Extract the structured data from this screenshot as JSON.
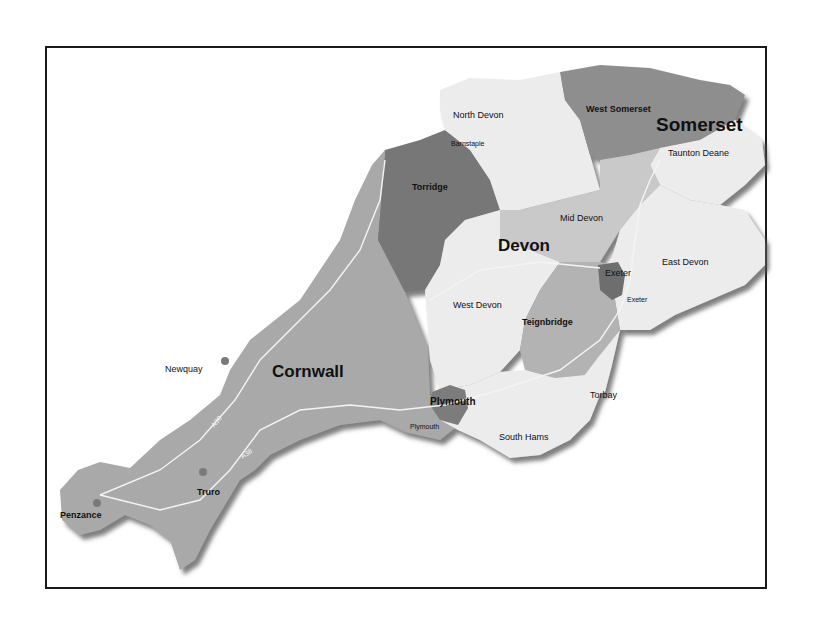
{
  "map": {
    "title": "South West England districts",
    "counties": [
      {
        "name": "Cornwall",
        "label": "Cornwall"
      },
      {
        "name": "Devon",
        "label": "Devon"
      },
      {
        "name": "Somerset",
        "label": "Somerset"
      }
    ],
    "districts": [
      {
        "name": "North Devon",
        "label": "North Devon"
      },
      {
        "name": "Barnstaple",
        "label": "Barnstaple"
      },
      {
        "name": "Torridge",
        "label": "Torridge"
      },
      {
        "name": "Mid Devon",
        "label": "Mid Devon"
      },
      {
        "name": "West Somerset",
        "label": "West Somerset"
      },
      {
        "name": "Taunton Deane",
        "label": "Taunton Deane"
      },
      {
        "name": "East Devon",
        "label": "East Devon"
      },
      {
        "name": "Exeter",
        "label": "Exeter"
      },
      {
        "name": "Exeter town",
        "label": "Exeter"
      },
      {
        "name": "West Devon",
        "label": "West Devon"
      },
      {
        "name": "Teignbridge",
        "label": "Teignbridge"
      },
      {
        "name": "Torbay",
        "label": "Torbay"
      },
      {
        "name": "Plymouth",
        "label": "Plymouth"
      },
      {
        "name": "Plymouth town",
        "label": "Plymouth"
      },
      {
        "name": "South Hams",
        "label": "South Hams"
      }
    ],
    "towns": [
      {
        "name": "Newquay",
        "label": "Newquay"
      },
      {
        "name": "Truro",
        "label": "Truro"
      },
      {
        "name": "Penzance",
        "label": "Penzance"
      }
    ],
    "roads": [
      {
        "name": "A30",
        "label": "A30"
      },
      {
        "name": "A38",
        "label": "A38"
      },
      {
        "name": "M5",
        "label": "M5"
      }
    ],
    "colors": {
      "cornwall": "#a9a9a9",
      "torridge": "#777777",
      "west_somerset": "#8e8e8e",
      "light_devon": "#ececec",
      "mid_devon": "#c9c9c9",
      "teignbridge": "#b3b3b3",
      "exeter": "#6e6e6e",
      "plymouth": "#7b7b7b",
      "frame": "#1a1a1a"
    }
  }
}
